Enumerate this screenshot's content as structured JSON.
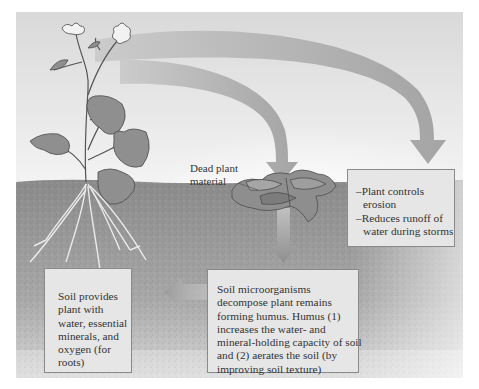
{
  "diagram": {
    "type": "illustration",
    "elements": {
      "dead_plant_label": [
        "Dead plant",
        "material"
      ],
      "erosion_box": {
        "lines": [
          "–Plant controls",
          "  erosion",
          "–Reduces runoff of",
          "  water during storms"
        ]
      },
      "humus_box": {
        "lines": [
          "Soil microorganisms",
          "decompose plant remains",
          "forming humus. Humus (1)",
          "increases the water- and",
          "mineral-holding capacity of soil",
          "and (2) aerates the soil (by",
          "improving soil texture)"
        ]
      },
      "soil_provides_box": {
        "lines": [
          "Soil provides",
          "plant with",
          "water, essential",
          "minerals, and",
          "oxygen (for",
          "roots)"
        ]
      }
    },
    "arrows": [
      {
        "from": "plant",
        "to": "dead-plant-material",
        "direction": "down"
      },
      {
        "from": "plant",
        "to": "erosion-box",
        "direction": "down"
      },
      {
        "from": "dead-plant-material",
        "to": "humus-box",
        "direction": "down"
      },
      {
        "from": "humus-box",
        "to": "soil-provides-box",
        "direction": "left"
      }
    ],
    "colors": {
      "sky": "#e9e9e9",
      "soil": "#8f8f8f",
      "box_fill": "#e6e6e6",
      "arrow": "#9a9a9a",
      "text": "#333333"
    }
  }
}
